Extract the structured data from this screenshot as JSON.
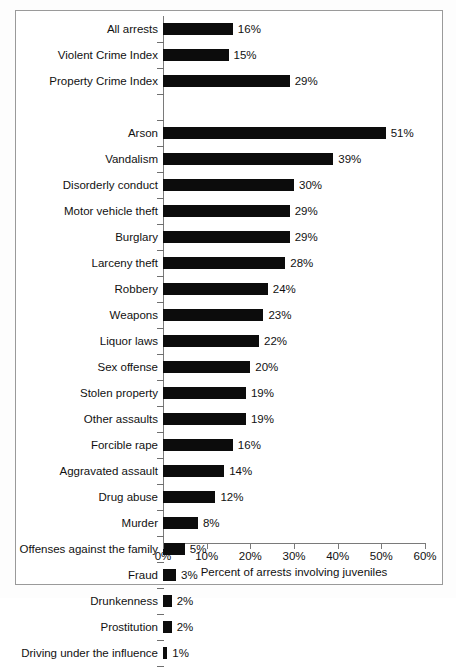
{
  "chart_data": {
    "type": "bar",
    "orientation": "horizontal",
    "title": "",
    "xlabel": "Percent of arrests involving juveniles",
    "ylabel": "",
    "xlim": [
      0,
      60
    ],
    "xticks": [
      "0%",
      "10%",
      "20%",
      "30%",
      "40%",
      "50%",
      "60%"
    ],
    "xtick_values": [
      0,
      10,
      20,
      30,
      40,
      50,
      60
    ],
    "grid": false,
    "legend": null,
    "bar_color": "#0c0c0c",
    "value_suffix": "%",
    "groups": [
      {
        "name": "summary",
        "rows": [
          {
            "category": "All arrests",
            "value": 16,
            "label": "16%"
          },
          {
            "category": "Violent Crime Index",
            "value": 15,
            "label": "15%"
          },
          {
            "category": "Property Crime Index",
            "value": 29,
            "label": "29%"
          }
        ]
      },
      {
        "name": "offenses",
        "rows": [
          {
            "category": "Arson",
            "value": 51,
            "label": "51%"
          },
          {
            "category": "Vandalism",
            "value": 39,
            "label": "39%"
          },
          {
            "category": "Disorderly conduct",
            "value": 30,
            "label": "30%"
          },
          {
            "category": "Motor vehicle theft",
            "value": 29,
            "label": "29%"
          },
          {
            "category": "Burglary",
            "value": 29,
            "label": "29%"
          },
          {
            "category": "Larceny theft",
            "value": 28,
            "label": "28%"
          },
          {
            "category": "Robbery",
            "value": 24,
            "label": "24%"
          },
          {
            "category": "Weapons",
            "value": 23,
            "label": "23%"
          },
          {
            "category": "Liquor laws",
            "value": 22,
            "label": "22%"
          },
          {
            "category": "Sex offense",
            "value": 20,
            "label": "20%"
          },
          {
            "category": "Stolen property",
            "value": 19,
            "label": "19%"
          },
          {
            "category": "Other assaults",
            "value": 19,
            "label": "19%"
          },
          {
            "category": "Forcible rape",
            "value": 16,
            "label": "16%"
          },
          {
            "category": "Aggravated assault",
            "value": 14,
            "label": "14%"
          },
          {
            "category": "Drug abuse",
            "value": 12,
            "label": "12%"
          },
          {
            "category": "Murder",
            "value": 8,
            "label": "8%"
          },
          {
            "category": "Offenses against the family",
            "value": 5,
            "label": "5%"
          },
          {
            "category": "Fraud",
            "value": 3,
            "label": "3%"
          },
          {
            "category": "Drunkenness",
            "value": 2,
            "label": "2%"
          },
          {
            "category": "Prostitution",
            "value": 2,
            "label": "2%"
          },
          {
            "category": "Driving under the influence",
            "value": 1,
            "label": "1%"
          }
        ]
      }
    ],
    "categories": [
      "All arrests",
      "Violent Crime Index",
      "Property Crime Index",
      "Arson",
      "Vandalism",
      "Disorderly conduct",
      "Motor vehicle theft",
      "Burglary",
      "Larceny theft",
      "Robbery",
      "Weapons",
      "Liquor laws",
      "Sex offense",
      "Stolen property",
      "Other assaults",
      "Forcible rape",
      "Aggravated assault",
      "Drug abuse",
      "Murder",
      "Offenses against the family",
      "Fraud",
      "Drunkenness",
      "Prostitution",
      "Driving under the influence"
    ],
    "values": [
      16,
      15,
      29,
      51,
      39,
      30,
      29,
      29,
      28,
      24,
      23,
      22,
      20,
      19,
      19,
      16,
      14,
      12,
      8,
      5,
      3,
      2,
      2,
      1
    ]
  }
}
